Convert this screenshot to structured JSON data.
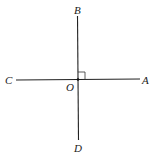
{
  "diagram": {
    "type": "perpendicular-lines",
    "labels": {
      "A": "A",
      "B": "B",
      "C": "C",
      "D": "D",
      "O": "O"
    },
    "lines": [
      {
        "name": "line-CA",
        "from": "C",
        "to": "A"
      },
      {
        "name": "line-BD",
        "from": "B",
        "to": "D"
      }
    ],
    "right_angle_at": "O",
    "colors": {
      "stroke": "#222222",
      "background": "#ffffff"
    }
  }
}
